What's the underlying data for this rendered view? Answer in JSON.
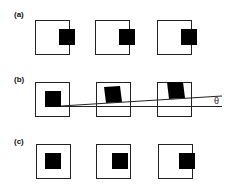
{
  "panels": [
    {
      "label": "(a)",
      "description": "Target square shifted to right edge of frame in each view"
    },
    {
      "label": "(b)",
      "description": "Target square drifting upward across frames with tilt line"
    },
    {
      "label": "(c)",
      "description": "Target square moving from center to right edge"
    }
  ],
  "annotation": {
    "angle_symbol": "θ"
  },
  "colors": {
    "stroke": "#222222",
    "fill": "#000000",
    "background": "#ffffff"
  }
}
